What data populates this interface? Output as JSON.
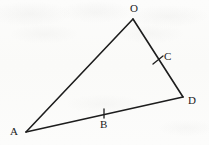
{
  "figure": {
    "kind": "geometry-diagram",
    "canvas": {
      "width": 209,
      "height": 145
    },
    "background_color": "#fbfbfa",
    "ink_color": "#1d1d1d",
    "vertices": [
      {
        "id": "O",
        "label": "O",
        "x": 133,
        "y": 19,
        "label_x": 130,
        "label_y": 3
      },
      {
        "id": "D",
        "label": "D",
        "x": 183,
        "y": 97,
        "label_x": 188,
        "label_y": 95
      },
      {
        "id": "A",
        "label": "A",
        "x": 26,
        "y": 132,
        "label_x": 10,
        "label_y": 126
      }
    ],
    "marked_points": [
      {
        "id": "C",
        "label": "C",
        "on_segment": "OD",
        "x": 158,
        "y": 60,
        "label_x": 164,
        "label_y": 51
      },
      {
        "id": "B",
        "label": "B",
        "on_segment": "AD",
        "x": 104,
        "y": 114,
        "label_x": 100,
        "label_y": 119
      }
    ],
    "edges": [
      {
        "id": "AO",
        "from": "A",
        "to": "O",
        "x1": 26,
        "y1": 132,
        "x2": 133,
        "y2": 19
      },
      {
        "id": "OD",
        "from": "O",
        "to": "D",
        "x1": 133,
        "y1": 19,
        "x2": 183,
        "y2": 97
      },
      {
        "id": "AD",
        "from": "A",
        "to": "D",
        "x1": 26,
        "y1": 132,
        "x2": 183,
        "y2": 97
      }
    ],
    "tick_marks": [
      {
        "id": "tick-C",
        "on_segment": "OD",
        "x1": 153,
        "y1": 64,
        "x2": 163,
        "y2": 56
      },
      {
        "id": "tick-B",
        "on_segment": "AD",
        "x1": 104,
        "y1": 109,
        "x2": 104,
        "y2": 118
      }
    ]
  }
}
